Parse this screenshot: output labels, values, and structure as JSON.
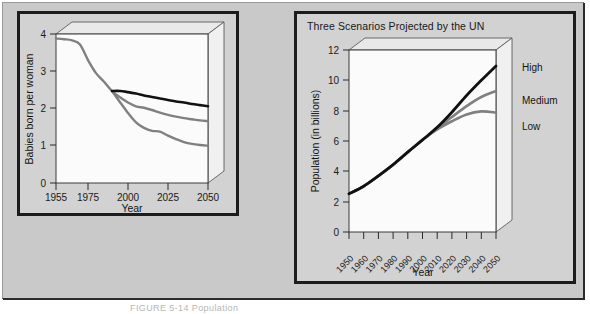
{
  "figure": {
    "caption": "FIGURE 5-14  Population"
  },
  "colors": {
    "panel_background": "#d2d2d2",
    "figure_background": "#c9c9c9",
    "plot_area": "#fbfbfb",
    "panel_border": "#1c1c1c",
    "series_high": "#111111",
    "series_medium": "#808080",
    "series_low": "#808080",
    "axis": "#2a2a2a",
    "box_top_face": "#e6e6e6",
    "box_side_face": "#efefef"
  },
  "chart_data": [
    {
      "id": "fertility",
      "type": "line",
      "title": "",
      "xlabel": "Year",
      "ylabel": "Babies born per woman",
      "xlim": [
        1955,
        2050
      ],
      "ylim": [
        0,
        4
      ],
      "xticks": [
        1955,
        1975,
        2000,
        2025,
        2050
      ],
      "xtick_labels": [
        "1955",
        "1975",
        "2000",
        "2025",
        "2050"
      ],
      "yticks": [
        0,
        1,
        2,
        3,
        4
      ],
      "ytick_labels": [
        "0",
        "1",
        "2",
        "3",
        "4"
      ],
      "grid": false,
      "legend": "none",
      "style": "3d-box",
      "series": [
        {
          "name": "High",
          "color": "#111111",
          "x": [
            1990,
            1995,
            2000,
            2005,
            2010,
            2015,
            2020,
            2025,
            2030,
            2035,
            2040,
            2045,
            2050
          ],
          "values": [
            2.47,
            2.47,
            2.44,
            2.4,
            2.35,
            2.31,
            2.27,
            2.23,
            2.19,
            2.16,
            2.12,
            2.09,
            2.06
          ]
        },
        {
          "name": "Medium",
          "color": "#808080",
          "x": [
            1955,
            1960,
            1965,
            1970,
            1975,
            1980,
            1985,
            1990,
            1995,
            2000,
            2005,
            2010,
            2015,
            2020,
            2025,
            2030,
            2035,
            2040,
            2045,
            2050
          ],
          "values": [
            3.88,
            3.86,
            3.83,
            3.72,
            3.3,
            2.95,
            2.72,
            2.47,
            2.3,
            2.16,
            2.06,
            2.02,
            1.96,
            1.89,
            1.83,
            1.78,
            1.74,
            1.71,
            1.68,
            1.66
          ]
        },
        {
          "name": "Low",
          "color": "#808080",
          "x": [
            1990,
            1995,
            2000,
            2005,
            2010,
            2015,
            2020,
            2025,
            2030,
            2035,
            2040,
            2045,
            2050
          ],
          "values": [
            2.47,
            2.17,
            1.88,
            1.63,
            1.48,
            1.4,
            1.38,
            1.27,
            1.18,
            1.1,
            1.05,
            1.02,
            1.0
          ]
        }
      ]
    },
    {
      "id": "population",
      "type": "line",
      "title": "Three Scenarios Projected by the UN",
      "xlabel": "Year",
      "ylabel": "Population (in billions)",
      "xlim": [
        1950,
        2050
      ],
      "ylim": [
        0,
        12
      ],
      "xticks": [
        1950,
        1960,
        1970,
        1980,
        1990,
        2000,
        2010,
        2020,
        2030,
        2040,
        2050
      ],
      "xtick_labels": [
        "1950",
        "1960",
        "1970",
        "1980",
        "1990",
        "2000",
        "2010",
        "2020",
        "2030",
        "2040",
        "2050"
      ],
      "yticks": [
        0,
        2,
        4,
        6,
        8,
        10,
        12
      ],
      "ytick_labels": [
        "0",
        "2",
        "4",
        "6",
        "8",
        "10",
        "12"
      ],
      "grid": false,
      "legend": "right-of-axes",
      "style": "3d-box",
      "series": [
        {
          "name": "High",
          "color": "#111111",
          "x": [
            1950,
            1960,
            1970,
            1980,
            1990,
            2000,
            2010,
            2020,
            2030,
            2040,
            2050
          ],
          "values": [
            2.52,
            3.02,
            3.7,
            4.44,
            5.27,
            6.07,
            6.9,
            7.9,
            9.0,
            10.0,
            10.95
          ]
        },
        {
          "name": "Medium",
          "color": "#808080",
          "x": [
            1950,
            1960,
            1970,
            1980,
            1990,
            2000,
            2010,
            2020,
            2030,
            2040,
            2050
          ],
          "values": [
            2.52,
            3.02,
            3.7,
            4.44,
            5.27,
            6.07,
            6.83,
            7.58,
            8.3,
            8.9,
            9.3
          ]
        },
        {
          "name": "Low",
          "color": "#808080",
          "x": [
            1950,
            1960,
            1970,
            1980,
            1990,
            2000,
            2010,
            2020,
            2030,
            2040,
            2050
          ],
          "values": [
            2.52,
            3.02,
            3.7,
            4.44,
            5.27,
            6.07,
            6.76,
            7.3,
            7.75,
            7.95,
            7.88
          ]
        }
      ],
      "legend_entries": [
        {
          "label": "High",
          "color": "#111111"
        },
        {
          "label": "Medium",
          "color": "#808080"
        },
        {
          "label": "Low",
          "color": "#808080"
        }
      ]
    }
  ]
}
